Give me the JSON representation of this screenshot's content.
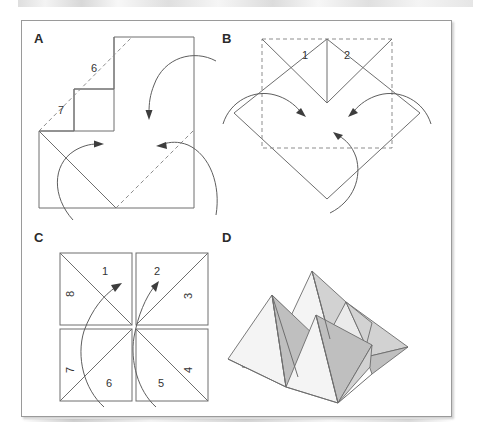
{
  "figure": {
    "panels": [
      {
        "id": "A",
        "letter": "A",
        "labels": [
          {
            "text": "6",
            "x": 96,
            "y": 66
          },
          {
            "text": "7",
            "x": 62,
            "y": 108
          }
        ],
        "description": "Square sheet with stepped notch, dashed fold diagonals and four curved fold arrows"
      },
      {
        "id": "B",
        "letter": "B",
        "labels": [
          {
            "text": "1",
            "x": 318,
            "y": 52
          },
          {
            "text": "2",
            "x": 355,
            "y": 52
          }
        ],
        "description": "Diamond with dashed inner square, V-notch at top and three curved fold arrows"
      },
      {
        "id": "C",
        "letter": "C",
        "labels": [
          {
            "text": "1",
            "x": 78,
            "y": 268
          },
          {
            "text": "8",
            "x": 52,
            "y": 296,
            "rotate": -90
          },
          {
            "text": "2",
            "x": 130,
            "y": 266
          },
          {
            "text": "3",
            "x": 166,
            "y": 297,
            "rotate": -90
          },
          {
            "text": "7",
            "x": 52,
            "y": 348,
            "rotate": -90
          },
          {
            "text": "6",
            "x": 84,
            "y": 379
          },
          {
            "text": "5",
            "x": 135,
            "y": 379
          },
          {
            "text": "4",
            "x": 166,
            "y": 348,
            "rotate": -90
          }
        ],
        "description": "Four squares in a 2x2 grid, each split by a diagonal into eight numbered triangles with two curved arrows"
      },
      {
        "id": "D",
        "letter": "D",
        "labels": [],
        "description": "Shaded three-dimensional folded zig-zag of pyramidal facets"
      }
    ]
  },
  "colors": {
    "ink": "#6e6e6e",
    "dash_ink": "#8d8d8d",
    "arrow": "#5e5e5e",
    "arrow_head": "#3d3d3d",
    "text": "#333333",
    "letter": "#2b2b2b",
    "frame": "#9a9a9a",
    "page": "#ffffff",
    "facet_light": "#ebebeb",
    "facet_mid": "#d2d2d2",
    "facet_dark": "#bfbfbf",
    "facet_xlight": "#f4f4f4"
  }
}
